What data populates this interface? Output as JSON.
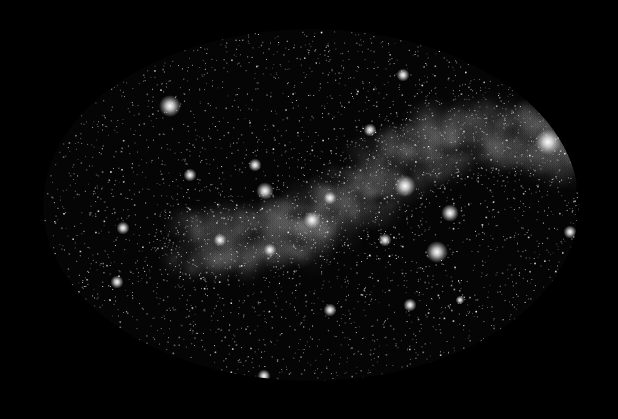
{
  "image": {
    "subject": "Milky Way all-sky star field",
    "background": "#000000",
    "ellipse": {
      "cx": 311,
      "cy": 205,
      "rx": 268,
      "ry": 176,
      "clip_right_x": 576
    },
    "band": {
      "points": [
        [
          190,
          245
        ],
        [
          240,
          240
        ],
        [
          280,
          235
        ],
        [
          320,
          215
        ],
        [
          360,
          190
        ],
        [
          400,
          160
        ],
        [
          440,
          140
        ],
        [
          490,
          130
        ],
        [
          540,
          140
        ],
        [
          575,
          150
        ]
      ],
      "glow_color": "#bdbdbd"
    },
    "bright_stars": [
      [
        170,
        106,
        5
      ],
      [
        548,
        142,
        6
      ],
      [
        405,
        186,
        5
      ],
      [
        437,
        252,
        5
      ],
      [
        450,
        213,
        4
      ],
      [
        265,
        191,
        4
      ],
      [
        123,
        228,
        3
      ],
      [
        95,
        330,
        3
      ],
      [
        190,
        175,
        3
      ],
      [
        370,
        130,
        3
      ],
      [
        403,
        75,
        3
      ],
      [
        264,
        376,
        3
      ],
      [
        570,
        232,
        3
      ],
      [
        330,
        198,
        3
      ],
      [
        117,
        282,
        3
      ],
      [
        410,
        305,
        3
      ],
      [
        330,
        310,
        3
      ],
      [
        312,
        220,
        4
      ],
      [
        270,
        250,
        3
      ],
      [
        255,
        165,
        3
      ],
      [
        220,
        240,
        3
      ],
      [
        385,
        240,
        3
      ],
      [
        520,
        80,
        2
      ],
      [
        460,
        300,
        2
      ]
    ],
    "star_count": 5200,
    "seed": 1337
  }
}
